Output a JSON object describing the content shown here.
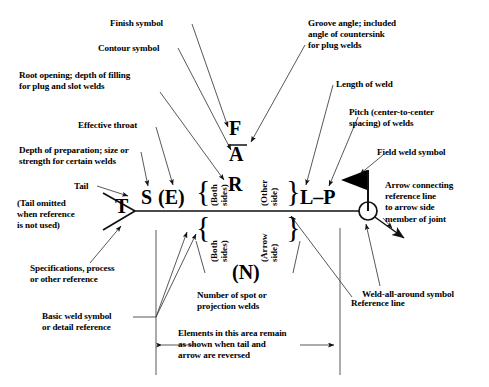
{
  "figure": {
    "stroke_color": "#1a1a1a",
    "fill_color": "#000000",
    "background": "#ffffff"
  },
  "symbols": {
    "finish": "F",
    "contour_root": "A",
    "groove_angle": "R",
    "depth_size": "S",
    "effective_throat": "(E)",
    "tail": "T",
    "length_pitch": "L–P",
    "number_of_welds": "(N)"
  },
  "side_labels": {
    "other_side": "(Other\nside)",
    "arrow_side": "(Arrow\nside)",
    "both_sides_upper": "(Both\nsides)",
    "both_sides_lower": "(Both\nsides)",
    "brace": "{"
  },
  "callouts": [
    {
      "id": "finish-symbol",
      "text": "Finish symbol"
    },
    {
      "id": "contour-symbol",
      "text": "Contour symbol"
    },
    {
      "id": "root-opening",
      "text": "Root opening; depth of filling\nfor plug and slot welds"
    },
    {
      "id": "effective-throat",
      "text": "Effective throat"
    },
    {
      "id": "depth-of-preparation",
      "text": "Depth of preparation; size or\nstrength for certain welds"
    },
    {
      "id": "tail",
      "text": "Tail"
    },
    {
      "id": "tail-omitted",
      "text": "(Tail omitted\nwhen reference\nis not used)"
    },
    {
      "id": "specifications",
      "text": "Specifications, process\nor other reference"
    },
    {
      "id": "basic-weld-symbol",
      "text": "Basic weld symbol\nor detail reference"
    },
    {
      "id": "groove-angle",
      "text": "Groove angle; included\nangle of countersink\nfor plug welds"
    },
    {
      "id": "length-of-weld",
      "text": "Length of weld"
    },
    {
      "id": "pitch-of-welds",
      "text": "Pitch (center-to-center\nspacing) of welds"
    },
    {
      "id": "field-weld-symbol",
      "text": "Field weld symbol"
    },
    {
      "id": "arrow-connecting",
      "text": "Arrow connecting\nreference line\nto arrow side\nmember of joint"
    },
    {
      "id": "weld-all-around",
      "text": "Weld-all-around symbol"
    },
    {
      "id": "reference-line",
      "text": "Reference line"
    },
    {
      "id": "number-of-spot",
      "text": "Number of spot or\nprojection welds"
    },
    {
      "id": "elements-remain",
      "text": "Elements in this area remain\nas shown when tail and\narrow are reversed"
    }
  ]
}
